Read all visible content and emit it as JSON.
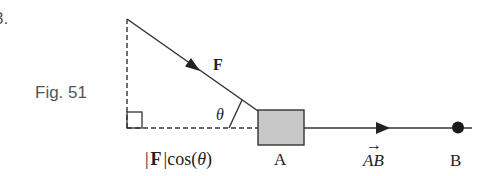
{
  "problem": {
    "number_label": "3."
  },
  "figure": {
    "caption": "Fig. 51",
    "labels": {
      "force": "F",
      "angle": "θ",
      "projection_abs_open": "|",
      "projection_force": "F",
      "projection_abs_close": "|",
      "projection_cos": "cos(",
      "projection_theta": "θ",
      "projection_close_paren": ")",
      "point_a": "A",
      "vector_ab_a": "A",
      "vector_ab_b": "B",
      "vector_arrow": "→",
      "point_b": "B"
    },
    "colors": {
      "stroke": "#333333",
      "block_fill": "#c8c8c8",
      "caption": "#555555",
      "text": "#222222"
    }
  }
}
